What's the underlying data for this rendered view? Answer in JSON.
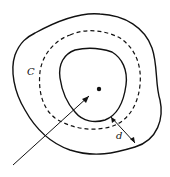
{
  "diagram": {
    "labels": {
      "curve": "C",
      "distance": "d",
      "center": "Φ"
    },
    "colors": {
      "stroke": "#111111",
      "background": "#ffffff"
    }
  }
}
